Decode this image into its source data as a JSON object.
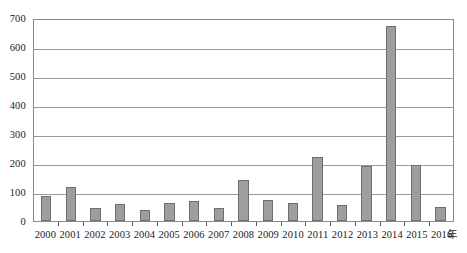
{
  "chart_data": {
    "type": "bar",
    "title": "",
    "xlabel": "年",
    "ylabel": "",
    "categories": [
      "2000",
      "2001",
      "2002",
      "2003",
      "2004",
      "2005",
      "2006",
      "2007",
      "2008",
      "2009",
      "2010",
      "2011",
      "2012",
      "2013",
      "2014",
      "2015",
      "2016"
    ],
    "values": [
      87,
      117,
      45,
      58,
      38,
      62,
      70,
      45,
      140,
      73,
      62,
      220,
      55,
      188,
      672,
      192,
      48
    ],
    "ylim": [
      0,
      700
    ],
    "yticks": [
      0,
      100,
      200,
      300,
      400,
      500,
      600,
      700
    ],
    "ytick_labels": [
      "0",
      "100",
      "200",
      "300",
      "400",
      "500",
      "600",
      "700"
    ],
    "grid": true,
    "legend": "none",
    "series": [
      {
        "name": "count",
        "values": [
          87,
          117,
          45,
          58,
          38,
          62,
          70,
          45,
          140,
          73,
          62,
          220,
          55,
          188,
          672,
          192,
          48
        ]
      }
    ],
    "colors": {
      "bar_fill": "#9e9e9e",
      "bar_border": "#6e6e6e",
      "gridline": "#9a9a9a",
      "axis": "#8a8a8a",
      "text": "#1a1a1a",
      "background": "#ffffff"
    }
  }
}
